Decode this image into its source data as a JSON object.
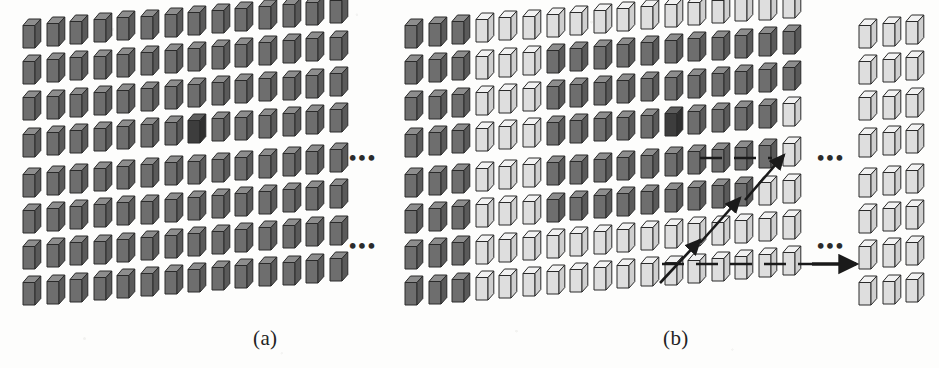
{
  "figure": {
    "width": 939,
    "height": 368,
    "background": "#fdfdfc",
    "caption_font_style": "serif-italic-none"
  },
  "colors": {
    "cube_dark_front": "#6e6e6e",
    "cube_dark_top": "#8d8d8d",
    "cube_dark_side": "#5a5a5a",
    "cube_highlight_front": "#3d3d3d",
    "cube_highlight_top": "#5e5e5e",
    "cube_highlight_side": "#2f2f2f",
    "cube_light_front": "#dedede",
    "cube_light_top": "#f2f2f2",
    "cube_light_side": "#cfcfcf",
    "outline": "#2a2a2a",
    "arrow": "#1a1a1a",
    "text": "#232323"
  },
  "panels": [
    {
      "id": "a",
      "label": "(a)",
      "label_x": 253,
      "label_y": 326,
      "origin_x": 22,
      "origin_y": 18,
      "columns": 14,
      "rows": 8,
      "col_step": 23.6,
      "row_step": 36.2,
      "col_rise": -1.9,
      "row_band_gap": 4.0,
      "default_shade": "dark",
      "highlight_cells": [
        {
          "row": 4,
          "col": 8
        }
      ],
      "light_cells": [],
      "ellipses": [
        {
          "x": 349,
          "y": 148,
          "text": "•••"
        },
        {
          "x": 349,
          "y": 236,
          "text": "•••"
        }
      ]
    },
    {
      "id": "b",
      "label": "(b)",
      "label_x": 663,
      "label_y": 326,
      "origin_x": 404,
      "origin_y": 18,
      "columns": 17,
      "rows": 8,
      "col_step": 23.6,
      "row_step": 36.2,
      "col_rise": -1.9,
      "row_band_gap": 4.0,
      "default_shade": "light",
      "dark_block_cols": [
        1,
        2,
        3
      ],
      "dark_region_note": "cols 1-3 all rows dark; cols 6-14 rows 2-4 dark; cols 5-13 rows 6-7 dark",
      "highlight_cells": [
        {
          "row": 4,
          "col": 12
        }
      ],
      "ellipses": [
        {
          "x": 817,
          "y": 148,
          "text": "•••"
        },
        {
          "x": 817,
          "y": 236,
          "text": "•••"
        }
      ]
    },
    {
      "id": "b-tail",
      "label": "",
      "origin_x": 858,
      "origin_y": 18,
      "columns": 3,
      "rows": 8,
      "col_step": 23.6,
      "row_step": 36.2,
      "col_rise": -1.9,
      "row_band_gap": 4.0,
      "default_shade": "light",
      "highlight_cells": [],
      "ellipses": []
    }
  ],
  "shading_map_b": {
    "note": "row (1-based from top) -> list of column indices (1-based) that are DARK",
    "rows": {
      "1": [
        1,
        2,
        3
      ],
      "2": [
        1,
        2,
        3,
        7,
        8,
        9,
        10,
        11,
        12,
        13,
        14,
        15,
        16,
        17
      ],
      "3": [
        1,
        2,
        3,
        7,
        8,
        9,
        10,
        11,
        12,
        13,
        14,
        15,
        16,
        17
      ],
      "4": [
        1,
        2,
        3,
        7,
        8,
        9,
        10,
        11,
        12,
        13,
        14,
        15,
        16
      ],
      "5": [
        1,
        2,
        3,
        7,
        8,
        9,
        10,
        11,
        12,
        13,
        14,
        15,
        16
      ],
      "6": [
        1,
        2,
        3,
        7,
        8,
        9,
        10,
        11,
        12,
        13,
        14,
        15
      ],
      "7": [
        1,
        2,
        3
      ],
      "8": [
        1,
        2,
        3
      ]
    }
  },
  "scan_path": {
    "description": "boustrophedon / zigzag raster scan arrows overlaid on panel (b)",
    "segments": [
      {
        "name": "seg-row4-right",
        "x1": 700,
        "y1": 158,
        "x2": 772,
        "y2": 158,
        "kind": "dashed-line"
      },
      {
        "name": "seg-diag-up-1",
        "x1": 745,
        "y1": 200,
        "x2": 784,
        "y2": 155,
        "kind": "solid-arrow"
      },
      {
        "name": "seg-diag-up-2",
        "x1": 700,
        "y1": 243,
        "x2": 740,
        "y2": 198,
        "kind": "solid-arrow"
      },
      {
        "name": "seg-diag-up-3",
        "x1": 660,
        "y1": 283,
        "x2": 700,
        "y2": 240,
        "kind": "solid-arrow"
      },
      {
        "name": "seg-row7-right",
        "x1": 662,
        "y1": 264,
        "x2": 812,
        "y2": 264,
        "kind": "dashed-line"
      },
      {
        "name": "seg-final-arrow",
        "x1": 812,
        "y1": 264,
        "x2": 856,
        "y2": 264,
        "kind": "solid-arrow-big"
      }
    ]
  },
  "accessibility": {
    "alt": "Two panels of 3D rectangular blocks arranged in a grid. Panel (a) shows a uniform dark grid with one darker highlighted block. Panel (b) shows a mixed grid of dark and light blocks with zigzag scan arrows tracing a raster path toward a detached group of light blocks on the right."
  }
}
